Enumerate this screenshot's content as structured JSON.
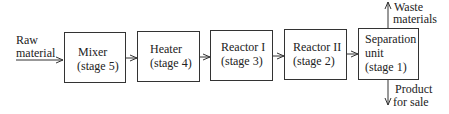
{
  "diagram": {
    "input_label": [
      "Raw",
      "material"
    ],
    "stages": [
      {
        "name": "Mixer",
        "stage": "(stage 5)"
      },
      {
        "name": "Heater",
        "stage": "(stage 4)"
      },
      {
        "name": "Reactor I",
        "stage": "(stage 3)"
      },
      {
        "name": "Reactor II",
        "stage": "(stage 2)"
      },
      {
        "name": "Separation",
        "name2": "unit",
        "stage": "(stage 1)"
      }
    ],
    "outputs": {
      "top": [
        "Waste",
        "materials"
      ],
      "bottom": [
        "Product",
        "for sale"
      ]
    }
  }
}
